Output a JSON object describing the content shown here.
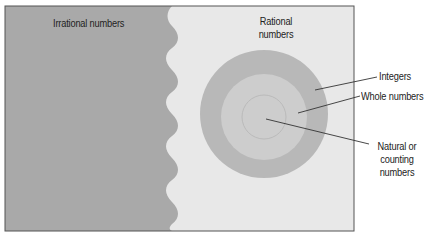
{
  "diagram": {
    "type": "nested-set-diagram",
    "regions": {
      "irrational": {
        "label": "Irrational numbers",
        "color": "#a9a9a9"
      },
      "rational": {
        "label_line1": "Rational",
        "label_line2": "numbers",
        "color": "#e8e8e8"
      }
    },
    "circles": [
      {
        "name": "integers",
        "label": "Integers",
        "color": "#b8b8b8"
      },
      {
        "name": "whole-numbers",
        "label": "Whole numbers",
        "color": "#cdcdcd"
      },
      {
        "name": "natural-numbers",
        "label_line1": "Natural or",
        "label_line2": "counting",
        "label_line3": "numbers",
        "color": "#cdcdcd"
      }
    ],
    "colors": {
      "border": "#555555",
      "leader_line": "#333333",
      "text": "#222222",
      "background": "#ffffff"
    }
  }
}
